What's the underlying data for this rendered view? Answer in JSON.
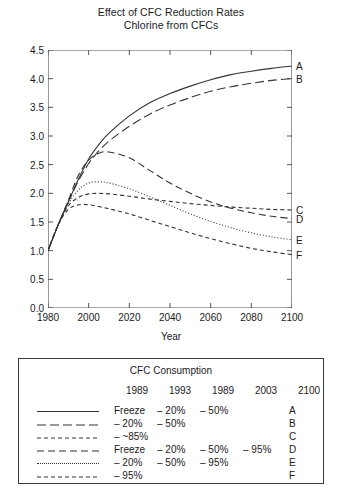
{
  "title": {
    "line1": "Effect of CFC Reduction Rates",
    "line2": "Chlorine from CFCs"
  },
  "axes": {
    "ylabel": "Concentration (ppb)",
    "xlabel": "Year",
    "yticks": [
      "0.0",
      "0.5",
      "1.0",
      "1.5",
      "2.0",
      "2.5",
      "3.0",
      "3.5",
      "4.0",
      "4.5"
    ],
    "xticks": [
      "1980",
      "2000",
      "2020",
      "2040",
      "2060",
      "2080",
      "2100"
    ]
  },
  "end_labels": [
    "A",
    "B",
    "C",
    "D",
    "E",
    "F"
  ],
  "legend": {
    "title": "CFC Consumption",
    "year_headers": [
      "1989",
      "1993",
      "1989",
      "2003",
      "2100"
    ],
    "rows": [
      {
        "letter": "A",
        "style": "solid",
        "cells": [
          "Freeze",
          "– 20%",
          "– 50%",
          "",
          ""
        ]
      },
      {
        "letter": "B",
        "style": "longdash",
        "cells": [
          "– 20%",
          "– 50%",
          "",
          "",
          ""
        ]
      },
      {
        "letter": "C",
        "style": "shortdash",
        "cells": [
          "– ~85%",
          "",
          "",
          "",
          ""
        ]
      },
      {
        "letter": "D",
        "style": "meddash",
        "cells": [
          "Freeze",
          "– 20%",
          "– 50%",
          "– 95%",
          ""
        ]
      },
      {
        "letter": "E",
        "style": "dotted",
        "cells": [
          "– 20%",
          "– 50%",
          "– 95%",
          "",
          ""
        ]
      },
      {
        "letter": "F",
        "style": "shortdash2",
        "cells": [
          "– 95%",
          "",
          "",
          "",
          ""
        ]
      }
    ]
  },
  "chart_data": {
    "type": "line",
    "xlabel": "Year",
    "ylabel": "Concentration (ppb)",
    "xlim": [
      1980,
      2100
    ],
    "ylim": [
      0.0,
      4.5
    ],
    "grid": false,
    "legend_position": "below-plot",
    "x": [
      1980,
      1985,
      1990,
      1995,
      2000,
      2005,
      2010,
      2020,
      2030,
      2040,
      2050,
      2060,
      2070,
      2080,
      2090,
      2100
    ],
    "series": [
      {
        "name": "A",
        "label": "Freeze 1989, -20% 1993, -50% 1989",
        "style": "solid",
        "values": [
          1.0,
          1.45,
          1.85,
          2.25,
          2.6,
          2.85,
          3.05,
          3.35,
          3.58,
          3.74,
          3.87,
          3.98,
          4.07,
          4.13,
          4.18,
          4.22
        ]
      },
      {
        "name": "B",
        "label": "-20% 1989, -50% 1993",
        "style": "longdash",
        "values": [
          1.0,
          1.45,
          1.85,
          2.22,
          2.52,
          2.74,
          2.91,
          3.17,
          3.38,
          3.54,
          3.67,
          3.78,
          3.86,
          3.92,
          3.97,
          4.0
        ]
      },
      {
        "name": "C",
        "label": "- ~85% 1989",
        "style": "shortdash",
        "values": [
          1.0,
          1.45,
          1.78,
          1.93,
          1.99,
          2.0,
          1.99,
          1.95,
          1.9,
          1.86,
          1.82,
          1.79,
          1.76,
          1.74,
          1.72,
          1.71
        ]
      },
      {
        "name": "D",
        "label": "Freeze 1989, -20% 1993, -50% 1989, -95% 2003",
        "style": "meddash",
        "values": [
          1.0,
          1.45,
          1.88,
          2.32,
          2.58,
          2.7,
          2.72,
          2.62,
          2.4,
          2.18,
          2.0,
          1.85,
          1.74,
          1.66,
          1.6,
          1.56
        ]
      },
      {
        "name": "E",
        "label": "-20% 1989, -50% 1993, -95% 1989",
        "style": "dotted",
        "values": [
          1.0,
          1.45,
          1.82,
          2.06,
          2.18,
          2.2,
          2.18,
          2.08,
          1.94,
          1.79,
          1.64,
          1.51,
          1.4,
          1.31,
          1.24,
          1.19
        ]
      },
      {
        "name": "F",
        "label": "-95% 1989",
        "style": "shortdash2",
        "values": [
          1.0,
          1.45,
          1.72,
          1.8,
          1.8,
          1.77,
          1.73,
          1.64,
          1.53,
          1.42,
          1.31,
          1.21,
          1.12,
          1.04,
          0.98,
          0.93
        ]
      }
    ]
  }
}
